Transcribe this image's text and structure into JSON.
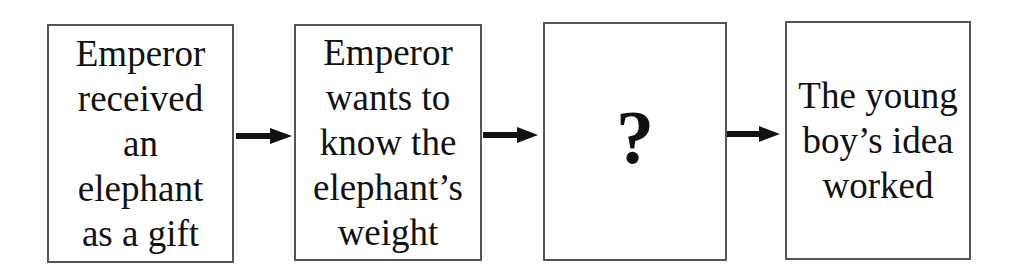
{
  "diagram": {
    "type": "flowchart",
    "direction": "left-to-right",
    "boxes": [
      {
        "id": "step1",
        "text": "Emperor\nreceived\nan\nelephant\nas a gift"
      },
      {
        "id": "step2",
        "text": "Emperor\nwants to\nknow the\nelephant’s\nweight"
      },
      {
        "id": "step3",
        "text": "?"
      },
      {
        "id": "step4",
        "text": "The young\nboy’s idea\nworked"
      }
    ],
    "arrows": [
      {
        "from": "step1",
        "to": "step2"
      },
      {
        "from": "step2",
        "to": "step3"
      },
      {
        "from": "step3",
        "to": "step4"
      }
    ],
    "colors": {
      "border": "#555555",
      "text": "#111111",
      "arrow": "#111111",
      "background": "#ffffff"
    }
  }
}
